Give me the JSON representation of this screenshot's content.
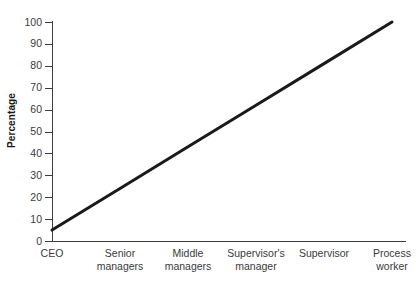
{
  "chart_data": {
    "type": "line",
    "title": "",
    "subtitle": "",
    "xlabel": "",
    "ylabel": "Percentage",
    "categories": [
      "CEO",
      "Senior\nmanagers",
      "Middle\nmanagers",
      "Supervisor's\nmanager",
      "Supervisor",
      "Process\nworker"
    ],
    "x": [
      0,
      1,
      2,
      3,
      4,
      5
    ],
    "values": [
      5,
      24,
      43,
      62,
      81,
      100
    ],
    "series": [
      {
        "name": "Percentage",
        "values": [
          5,
          24,
          43,
          62,
          81,
          100
        ]
      }
    ],
    "ylim": [
      0,
      100
    ],
    "ytick_values": [
      0,
      10,
      20,
      30,
      40,
      50,
      60,
      70,
      80,
      90,
      100
    ],
    "ytick_labels": [
      "0",
      "10",
      "20",
      "30",
      "40",
      "50",
      "60",
      "70",
      "80",
      "90",
      "100"
    ],
    "grid": false,
    "legend": false,
    "legend_position": "none",
    "line_color": "#1a1a1a",
    "line_width": 3,
    "axis_color": "#3d3d3d",
    "background_color": "#ffffff",
    "text_color": "#3a3a3a"
  }
}
